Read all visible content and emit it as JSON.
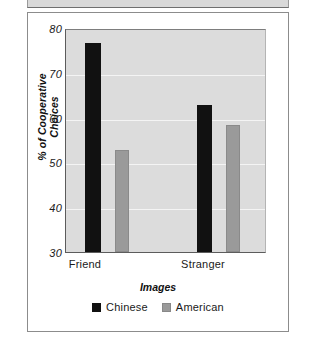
{
  "figure": {
    "frame_border_color": "#8c8c8c",
    "plot_bg_color": "#dcdcdc"
  },
  "chart_data": {
    "type": "bar",
    "title": "",
    "xlabel": "Images",
    "ylabel": "% of Cooperative Choices",
    "categories": [
      "Friend",
      "Stranger"
    ],
    "series": [
      {
        "name": "Chinese",
        "color": "#111111",
        "values": [
          77,
          63
        ]
      },
      {
        "name": "American",
        "color": "#9a9a9a",
        "values": [
          53,
          58.5
        ]
      }
    ],
    "ylim": [
      30,
      80
    ],
    "yticks": [
      30,
      40,
      50,
      60,
      70,
      80
    ],
    "ytick_labels": [
      "30",
      "40",
      "50",
      "60",
      "70",
      "80"
    ],
    "grid": true,
    "grid_color": "#f4f4f4",
    "legend_position": "bottom-center",
    "legend_entries": [
      "Chinese",
      "American"
    ]
  },
  "axis": {
    "y_ticks": [
      {
        "label": "80",
        "value": 80
      },
      {
        "label": "70",
        "value": 70
      },
      {
        "label": "60",
        "value": 60
      },
      {
        "label": "50",
        "value": 50
      },
      {
        "label": "40",
        "value": 40
      },
      {
        "label": "30",
        "value": 30
      }
    ],
    "x_ticks": [
      {
        "label": "Friend"
      },
      {
        "label": "Stranger"
      }
    ],
    "y_title": "% of Cooperative Choices",
    "x_title": "Images"
  },
  "legend": {
    "items": [
      {
        "label": "Chinese",
        "swatch": "black-square-swatch"
      },
      {
        "label": "American",
        "swatch": "gray-square-swatch"
      }
    ]
  }
}
